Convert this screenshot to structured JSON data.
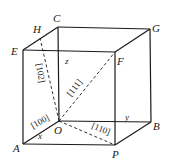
{
  "diagram": {
    "type": "crystal-cube-directions",
    "vertices": {
      "C": "C",
      "G": "G",
      "E": "E",
      "F": "F",
      "H": "H",
      "O": "O",
      "B": "B",
      "A": "A",
      "P": "P"
    },
    "axes": {
      "x": "x",
      "y": "y",
      "z": "z"
    },
    "directions": [
      {
        "label": "[102]",
        "from": "O",
        "to": "H"
      },
      {
        "label": "[111]",
        "from": "O",
        "to": "F"
      },
      {
        "label": "[100]",
        "from": "O",
        "to": "A"
      },
      {
        "label": "[110]",
        "from": "O",
        "to": "P"
      }
    ],
    "colors": {
      "line": "#1a1a1a",
      "background": "#ffffff"
    }
  }
}
